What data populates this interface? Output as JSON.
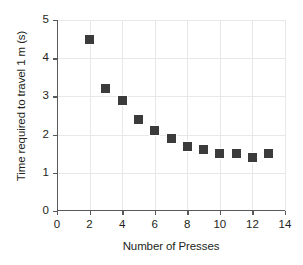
{
  "chart_data": {
    "type": "scatter",
    "title": "",
    "xlabel": "Number of Presses",
    "ylabel": "Time required to travel 1 m (s)",
    "xlim": [
      0,
      14
    ],
    "ylim": [
      0,
      5
    ],
    "grid": true,
    "legend": null,
    "marker": {
      "shape": "square",
      "color": "#3b3b3b",
      "size_px": 9
    },
    "x_ticks": [
      0,
      2,
      4,
      6,
      8,
      10,
      12,
      14
    ],
    "x_tick_labels": [
      "0",
      "2",
      "4",
      "6",
      "8",
      "10",
      "12",
      "14"
    ],
    "x_minor_ticks": [
      1,
      3,
      5,
      7,
      9,
      11,
      13
    ],
    "y_ticks": [
      0,
      1,
      2,
      3,
      4,
      5
    ],
    "y_tick_labels": [
      "0",
      "1",
      "2",
      "3",
      "4",
      "5"
    ],
    "x": [
      2,
      3,
      4,
      5,
      6,
      7,
      8,
      9,
      10,
      11,
      12,
      13
    ],
    "values": [
      4.5,
      3.2,
      2.9,
      2.4,
      2.1,
      1.9,
      1.7,
      1.6,
      1.5,
      1.5,
      1.4,
      1.5
    ],
    "points": [
      {
        "x": 2,
        "y": 4.5
      },
      {
        "x": 3,
        "y": 3.2
      },
      {
        "x": 4,
        "y": 2.9
      },
      {
        "x": 5,
        "y": 2.4
      },
      {
        "x": 6,
        "y": 2.1
      },
      {
        "x": 7,
        "y": 1.9
      },
      {
        "x": 8,
        "y": 1.7
      },
      {
        "x": 9,
        "y": 1.6
      },
      {
        "x": 10,
        "y": 1.5
      },
      {
        "x": 11,
        "y": 1.5
      },
      {
        "x": 12,
        "y": 1.4
      },
      {
        "x": 13,
        "y": 1.5
      }
    ]
  },
  "colors": {
    "marker": "#3b3b3b",
    "axis": "#58595b",
    "grid": "#e8e8e8",
    "text": "#231f20",
    "background": "#ffffff"
  }
}
